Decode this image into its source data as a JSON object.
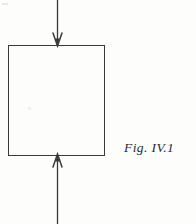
{
  "figure": {
    "caption": "Fig. IV.1",
    "background_color": "#fdfdfc",
    "ink_color": "#3a3a3a",
    "caption_color": "#2b2b2b"
  },
  "diagram_data": {
    "type": "free-body-diagram",
    "description": "Rectangular block under uniaxial compression with one downward force arrow at the top face and one upward force arrow at the bottom face.",
    "canvas": {
      "width": 196,
      "height": 224
    },
    "shapes": [
      {
        "name": "block",
        "kind": "rectangle",
        "x": 8,
        "y": 45,
        "width": 96,
        "height": 110,
        "stroke": "#3a3a3a",
        "stroke_width": 1.3,
        "fill": "none"
      }
    ],
    "arrows": [
      {
        "name": "top-load-arrow",
        "direction": "down",
        "shaft_x": 57,
        "from_y": 0,
        "to_y": 46,
        "head_width": 9,
        "head_length": 13,
        "head_style": "open-v",
        "stroke": "#3a3a3a",
        "stroke_width": 1.3
      },
      {
        "name": "bottom-load-arrow",
        "direction": "up",
        "shaft_x": 57,
        "from_y": 224,
        "to_y": 154,
        "head_width": 9,
        "head_length": 13,
        "head_style": "open-v",
        "stroke": "#3a3a3a",
        "stroke_width": 1.3
      }
    ],
    "labels": [
      {
        "name": "figure-caption",
        "text": "Fig. IV.1",
        "x": 124,
        "y": 140,
        "style": "italic-serif"
      }
    ]
  }
}
